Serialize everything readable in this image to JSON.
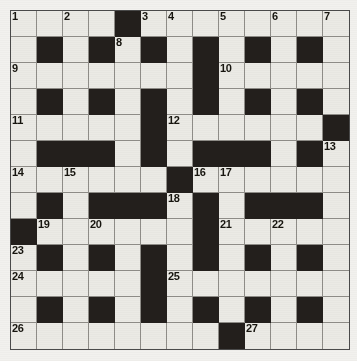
{
  "page": {
    "type": "crossword-puzzle-grid",
    "top_fragment_text": "",
    "rows": 13,
    "cols": 13,
    "colors": {
      "paper": "#f2f1ee",
      "white_cell": "#ebeae5",
      "black_cell": "#231f1c",
      "grid_line": "#8f8d88",
      "number_text": "#17150f"
    }
  },
  "crossword": {
    "grid": [
      [
        "W",
        "W",
        "W",
        "W",
        "B",
        "W",
        "W",
        "W",
        "W",
        "W",
        "W",
        "W",
        "W"
      ],
      [
        "W",
        "B",
        "W",
        "B",
        "W",
        "B",
        "W",
        "B",
        "W",
        "B",
        "W",
        "B",
        "W"
      ],
      [
        "W",
        "W",
        "W",
        "W",
        "W",
        "W",
        "W",
        "B",
        "W",
        "W",
        "W",
        "W",
        "W"
      ],
      [
        "W",
        "B",
        "W",
        "B",
        "W",
        "B",
        "W",
        "B",
        "W",
        "B",
        "W",
        "B",
        "W"
      ],
      [
        "W",
        "W",
        "W",
        "W",
        "W",
        "B",
        "W",
        "W",
        "W",
        "W",
        "W",
        "W",
        "B"
      ],
      [
        "W",
        "B",
        "B",
        "B",
        "W",
        "B",
        "W",
        "B",
        "B",
        "B",
        "W",
        "B",
        "W"
      ],
      [
        "W",
        "W",
        "W",
        "W",
        "W",
        "W",
        "B",
        "W",
        "W",
        "W",
        "W",
        "W",
        "W"
      ],
      [
        "W",
        "B",
        "W",
        "B",
        "B",
        "B",
        "W",
        "B",
        "W",
        "B",
        "B",
        "B",
        "W"
      ],
      [
        "B",
        "W",
        "W",
        "W",
        "W",
        "W",
        "W",
        "B",
        "W",
        "W",
        "W",
        "W",
        "W"
      ],
      [
        "W",
        "B",
        "W",
        "B",
        "W",
        "B",
        "W",
        "B",
        "W",
        "B",
        "W",
        "B",
        "W"
      ],
      [
        "W",
        "W",
        "W",
        "W",
        "W",
        "B",
        "W",
        "W",
        "W",
        "W",
        "W",
        "W",
        "W"
      ],
      [
        "W",
        "B",
        "W",
        "B",
        "W",
        "B",
        "W",
        "B",
        "W",
        "B",
        "W",
        "B",
        "W"
      ],
      [
        "W",
        "W",
        "W",
        "W",
        "W",
        "W",
        "W",
        "W",
        "B",
        "W",
        "W",
        "W",
        "W"
      ]
    ],
    "numbers": [
      {
        "row": 1,
        "col": 1,
        "label": "1"
      },
      {
        "row": 1,
        "col": 3,
        "label": "2"
      },
      {
        "row": 1,
        "col": 6,
        "label": "3"
      },
      {
        "row": 1,
        "col": 7,
        "label": "4"
      },
      {
        "row": 1,
        "col": 9,
        "label": "5"
      },
      {
        "row": 1,
        "col": 11,
        "label": "6"
      },
      {
        "row": 1,
        "col": 13,
        "label": "7"
      },
      {
        "row": 2,
        "col": 5,
        "label": "8"
      },
      {
        "row": 3,
        "col": 1,
        "label": "9"
      },
      {
        "row": 3,
        "col": 9,
        "label": "10"
      },
      {
        "row": 5,
        "col": 1,
        "label": "11"
      },
      {
        "row": 5,
        "col": 7,
        "label": "12"
      },
      {
        "row": 6,
        "col": 13,
        "label": "13"
      },
      {
        "row": 7,
        "col": 1,
        "label": "14"
      },
      {
        "row": 7,
        "col": 3,
        "label": "15"
      },
      {
        "row": 7,
        "col": 8,
        "label": "16"
      },
      {
        "row": 7,
        "col": 9,
        "label": "17"
      },
      {
        "row": 8,
        "col": 7,
        "label": "18"
      },
      {
        "row": 9,
        "col": 2,
        "label": "19"
      },
      {
        "row": 9,
        "col": 4,
        "label": "20"
      },
      {
        "row": 9,
        "col": 9,
        "label": "21"
      },
      {
        "row": 9,
        "col": 11,
        "label": "22"
      },
      {
        "row": 10,
        "col": 1,
        "label": "23"
      },
      {
        "row": 11,
        "col": 1,
        "label": "24"
      },
      {
        "row": 11,
        "col": 7,
        "label": "25"
      },
      {
        "row": 13,
        "col": 1,
        "label": "26"
      },
      {
        "row": 13,
        "col": 10,
        "label": "27"
      }
    ]
  }
}
